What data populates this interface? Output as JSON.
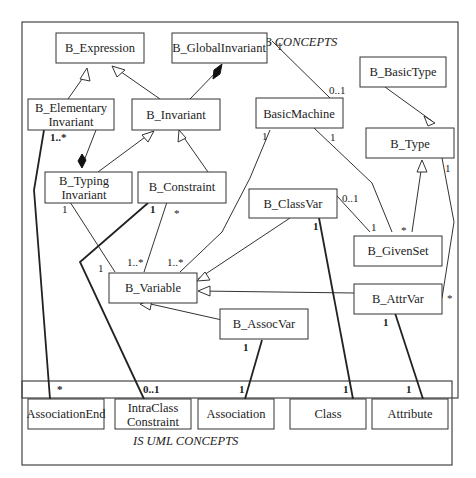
{
  "packages": {
    "b_concepts": {
      "title": "B CONCEPTS"
    },
    "uml_concepts": {
      "title": "IS UML CONCEPTS"
    }
  },
  "classes": {
    "b_expression": [
      "B_Expression"
    ],
    "b_globalinvariant": [
      "B_GlobalInvariant"
    ],
    "b_basictype": [
      "B_BasicType"
    ],
    "b_elementaryinvariant": [
      "B_Elementary",
      "Invariant"
    ],
    "b_invariant": [
      "B_Invariant"
    ],
    "basicmachine": [
      "BasicMachine"
    ],
    "b_type": [
      "B_Type"
    ],
    "b_typinginvariant": [
      "B_Typing",
      "Invariant"
    ],
    "b_constraint": [
      "B_Constraint"
    ],
    "b_classvar": [
      "B_ClassVar"
    ],
    "b_givenset": [
      "B_GivenSet"
    ],
    "b_variable": [
      "B_Variable"
    ],
    "b_attrvar": [
      "B_AttrVar"
    ],
    "b_assocvar": [
      "B_AssocVar"
    ],
    "associationend": [
      "AssociationEnd"
    ],
    "intraclassconstraint": [
      "IntraClass",
      "Constraint"
    ],
    "association": [
      "Association"
    ],
    "class": [
      "Class"
    ],
    "attribute": [
      "Attribute"
    ]
  },
  "multiplicities": {
    "globalinv_to_machine_src": "1",
    "globalinv_to_machine_dst": "0..1",
    "elementary_to_typing": "1..*",
    "typing_to_variable_src": "1",
    "typing_to_variable_dst": "1..*",
    "constraint_to_intraclass_src": "1",
    "constraint_to_variable_src": "*",
    "machine_to_variable_dst": "1..*",
    "machine_to_variable_src": "1",
    "machine_to_givenset_src": "1",
    "classvar_to_givenset_src": "0..1",
    "classvar_to_givenset_dst": "1",
    "type_to_givenset": "*",
    "type_to_attrvar_src": "1",
    "type_to_attrvar_dst": "*",
    "typing_to_intraclass": "1",
    "classvar_to_class_src": "1",
    "attrvar_to_attribute_src": "1",
    "assocvar_to_association_src": "1",
    "associationend": "*",
    "intraclass": "0..1",
    "association": "1",
    "class": "1",
    "attribute": "1"
  }
}
